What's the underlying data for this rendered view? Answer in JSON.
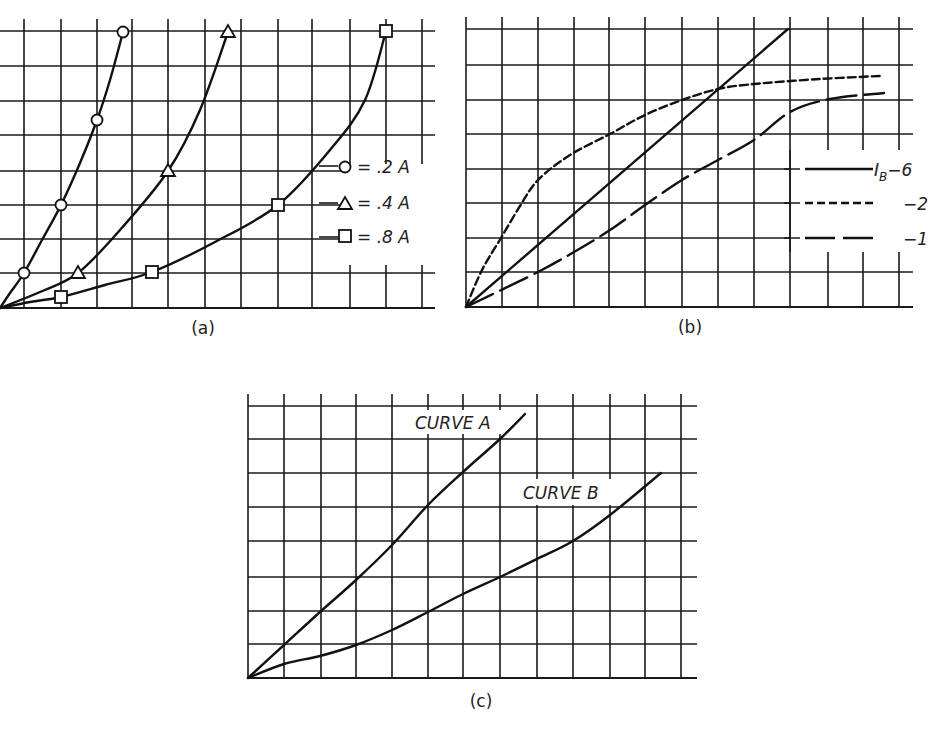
{
  "figure": {
    "panels": [
      "(a)",
      "(b)",
      "(c)"
    ]
  },
  "chart_data": [
    {
      "id": "a",
      "type": "line",
      "title": "",
      "caption": "(a)",
      "xlabel": "",
      "ylabel": "",
      "grid": true,
      "grid_cells": {
        "x": 12,
        "y": 8
      },
      "frame_px": {
        "x0": 0,
        "x1": 435,
        "y0": 308,
        "y1": 31
      },
      "v_grid_px": [
        24,
        61,
        97,
        132,
        168,
        205,
        241,
        278,
        312,
        350,
        386,
        422
      ],
      "h_grid_px": [
        31,
        66,
        101,
        135,
        171,
        205,
        239,
        273,
        308
      ],
      "legend": [
        {
          "marker": "circle",
          "label": "= .2 A"
        },
        {
          "marker": "triangle",
          "label": "= .4 A"
        },
        {
          "marker": "square",
          "label": "= .8 A"
        }
      ],
      "legend_position": "right-middle",
      "series": [
        {
          "name": ".2 A",
          "marker": "circle",
          "points_grid": [
            [
              0,
              0
            ],
            [
              0.66,
              1
            ],
            [
              1.7,
              3
            ],
            [
              2.7,
              5.5
            ],
            [
              3.4,
              8
            ]
          ],
          "markers_px": [
            [
              24,
              273
            ],
            [
              61,
              205
            ],
            [
              97,
              120
            ],
            [
              123,
              32
            ]
          ],
          "path_px": [
            [
              0,
              308
            ],
            [
              10,
              293
            ],
            [
              24,
              273
            ],
            [
              42,
              240
            ],
            [
              61,
              205
            ],
            [
              80,
              163
            ],
            [
              97,
              120
            ],
            [
              110,
              80
            ],
            [
              123,
              32
            ]
          ]
        },
        {
          "name": ".4 A",
          "marker": "triangle",
          "points_grid": [
            [
              0,
              0
            ],
            [
              2.2,
              1
            ],
            [
              4.7,
              4
            ],
            [
              6.3,
              8
            ]
          ],
          "markers_px": [
            [
              78,
              273
            ],
            [
              168,
              171
            ],
            [
              228,
              32
            ]
          ],
          "path_px": [
            [
              0,
              308
            ],
            [
              40,
              292
            ],
            [
              78,
              273
            ],
            [
              120,
              230
            ],
            [
              168,
              171
            ],
            [
              200,
              110
            ],
            [
              228,
              32
            ]
          ]
        },
        {
          "name": ".8 A",
          "marker": "square",
          "points_grid": [
            [
              0,
              0
            ],
            [
              1.7,
              0.33
            ],
            [
              4.2,
              1
            ],
            [
              7.7,
              3
            ],
            [
              10.7,
              8
            ]
          ],
          "markers_px": [
            [
              61,
              297
            ],
            [
              152,
              272
            ],
            [
              278,
              205
            ],
            [
              386,
              31
            ]
          ],
          "path_px": [
            [
              0,
              308
            ],
            [
              30,
              302
            ],
            [
              61,
              297
            ],
            [
              105,
              285
            ],
            [
              152,
              272
            ],
            [
              215,
              242
            ],
            [
              278,
              205
            ],
            [
              330,
              150
            ],
            [
              365,
              100
            ],
            [
              386,
              31
            ]
          ]
        }
      ]
    },
    {
      "id": "b",
      "type": "line",
      "title": "",
      "caption": "(b)",
      "xlabel": "",
      "ylabel": "",
      "grid": true,
      "grid_cells": {
        "x": 12,
        "y": 8
      },
      "frame_px": {
        "x0": 466,
        "x1": 913,
        "y0": 307,
        "y1": 29
      },
      "v_grid_px": [
        466,
        502,
        538,
        574,
        609,
        645,
        682,
        718,
        754,
        790,
        828,
        863,
        899
      ],
      "h_grid_px": [
        29,
        65,
        100,
        134,
        169,
        203,
        238,
        272,
        307
      ],
      "legend": [
        {
          "style": "solid",
          "label": "I_B -6",
          "prefix": "I",
          "subscript": "B",
          "value": "−6"
        },
        {
          "style": "short-dash",
          "label": "-2",
          "value": "−2"
        },
        {
          "style": "long-dash",
          "label": "-1",
          "value": "−1"
        }
      ],
      "legend_position": "right-middle",
      "series": [
        {
          "name": "I_B = -6",
          "style": "solid",
          "points_grid": [
            [
              0,
              0
            ],
            [
              9,
              8
            ]
          ],
          "path_px": [
            [
              466,
              307
            ],
            [
              788,
              29
            ]
          ]
        },
        {
          "name": "I_B = -2",
          "style": "short-dash",
          "points_grid": [
            [
              0,
              0
            ],
            [
              1,
              2
            ],
            [
              2,
              3.7
            ],
            [
              4,
              5
            ],
            [
              6,
              6
            ],
            [
              8,
              6.5
            ],
            [
              11.5,
              6.7
            ]
          ],
          "path_px": [
            [
              466,
              307
            ],
            [
              482,
              270
            ],
            [
              501,
              238
            ],
            [
              520,
              206
            ],
            [
              538,
              180
            ],
            [
              570,
              155
            ],
            [
              610,
              134
            ],
            [
              645,
              115
            ],
            [
              682,
              100
            ],
            [
              718,
              89
            ],
            [
              754,
              84
            ],
            [
              820,
              79
            ],
            [
              880,
              76
            ]
          ]
        },
        {
          "name": "I_B = -1",
          "style": "long-dash",
          "points_grid": [
            [
              0,
              0
            ],
            [
              1,
              0.5
            ],
            [
              2,
              1
            ],
            [
              4,
              2.2
            ],
            [
              6,
              3.7
            ],
            [
              7,
              4.3
            ],
            [
              9,
              5.7
            ],
            [
              11.5,
              6.2
            ]
          ],
          "path_px": [
            [
              466,
              307
            ],
            [
              497,
              292
            ],
            [
              538,
              272
            ],
            [
              574,
              252
            ],
            [
              610,
              230
            ],
            [
              645,
              205
            ],
            [
              682,
              180
            ],
            [
              718,
              160
            ],
            [
              754,
              140
            ],
            [
              790,
              112
            ],
            [
              830,
              99
            ],
            [
              884,
              93
            ]
          ]
        }
      ]
    },
    {
      "id": "c",
      "type": "line",
      "title": "",
      "caption": "(c)",
      "xlabel": "",
      "ylabel": "",
      "grid": true,
      "grid_cells": {
        "x": 12,
        "y": 8
      },
      "frame_px": {
        "x0": 248,
        "x1": 697,
        "y0": 678,
        "y1": 406
      },
      "v_grid_px": [
        248,
        284,
        321,
        356,
        392,
        428,
        463,
        500,
        537,
        573,
        610,
        645,
        681
      ],
      "h_grid_px": [
        406,
        439,
        473,
        507,
        541,
        577,
        611,
        644,
        678
      ],
      "annotations": [
        {
          "text": "CURVE A",
          "x": 418,
          "y": 423
        },
        {
          "text": "CURVE B",
          "x": 524,
          "y": 496
        }
      ],
      "series": [
        {
          "name": "CURVE A",
          "style": "solid",
          "points_grid": [
            [
              0,
              0
            ],
            [
              2,
              2
            ],
            [
              4,
              4
            ],
            [
              5,
              5
            ],
            [
              6,
              6
            ],
            [
              7.3,
              7.5
            ]
          ],
          "path_px": [
            [
              248,
              678
            ],
            [
              284,
              645
            ],
            [
              320,
              612
            ],
            [
              356,
              580
            ],
            [
              392,
              545
            ],
            [
              428,
              505
            ],
            [
              463,
              472
            ],
            [
              500,
              439
            ],
            [
              525,
              414
            ]
          ]
        },
        {
          "name": "CURVE B",
          "style": "solid",
          "points_grid": [
            [
              0,
              0
            ],
            [
              3,
              1
            ],
            [
              5,
              2
            ],
            [
              7,
              3
            ],
            [
              9,
              4
            ],
            [
              10,
              5
            ],
            [
              11.5,
              6
            ]
          ],
          "path_px": [
            [
              248,
              678
            ],
            [
              284,
              664
            ],
            [
              320,
              656
            ],
            [
              356,
              645
            ],
            [
              392,
              630
            ],
            [
              428,
              612
            ],
            [
              463,
              594
            ],
            [
              500,
              577
            ],
            [
              537,
              559
            ],
            [
              573,
              541
            ],
            [
              610,
              515
            ],
            [
              661,
              473
            ]
          ]
        }
      ]
    }
  ]
}
